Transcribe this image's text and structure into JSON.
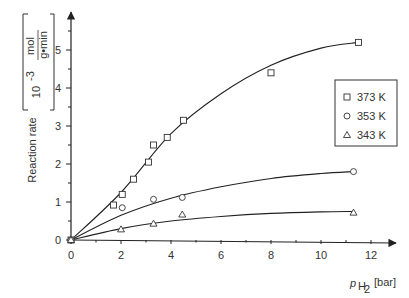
{
  "chart_data": {
    "type": "scatter",
    "title": "",
    "xlabel": "p_H2 [bar]",
    "xlabel_main": "p",
    "xlabel_sub": "H",
    "xlabel_subsub": "2",
    "xlabel_unit": "[bar]",
    "ylabel": "Reaction rate [10^-3 mol/(g·min)]",
    "ylabel_main": "Reaction rate",
    "ylabel_unit_factor": "10",
    "ylabel_unit_exp": "-3",
    "ylabel_unit_num": "mol",
    "ylabel_unit_den": "g•min",
    "xlim": [
      0,
      13
    ],
    "ylim": [
      0,
      6
    ],
    "x_ticks": [
      0,
      2,
      4,
      6,
      8,
      10,
      12
    ],
    "y_ticks": [
      0,
      1,
      2,
      3,
      4,
      5
    ],
    "grid": false,
    "legend_position": "right",
    "series": [
      {
        "name": "373 K",
        "marker": "square",
        "points": [
          [
            0,
            0
          ],
          [
            1.7,
            0.92
          ],
          [
            2.05,
            1.2
          ],
          [
            2.5,
            1.6
          ],
          [
            3.1,
            2.05
          ],
          [
            3.3,
            2.5
          ],
          [
            3.85,
            2.7
          ],
          [
            4.5,
            3.15
          ],
          [
            8.0,
            4.4
          ],
          [
            11.5,
            5.2
          ]
        ],
        "fit_curve": [
          [
            0,
            0
          ],
          [
            2,
            1.25
          ],
          [
            4,
            2.8
          ],
          [
            6,
            3.85
          ],
          [
            8,
            4.6
          ],
          [
            10,
            5.05
          ],
          [
            11.5,
            5.2
          ]
        ]
      },
      {
        "name": "353 K",
        "marker": "circle",
        "points": [
          [
            0,
            0
          ],
          [
            2.05,
            0.85
          ],
          [
            3.3,
            1.07
          ],
          [
            4.45,
            1.12
          ],
          [
            11.3,
            1.8
          ]
        ],
        "fit_curve": [
          [
            0,
            0
          ],
          [
            2,
            0.65
          ],
          [
            4,
            1.1
          ],
          [
            6,
            1.4
          ],
          [
            8,
            1.62
          ],
          [
            10,
            1.75
          ],
          [
            11.3,
            1.8
          ]
        ]
      },
      {
        "name": "343 K",
        "marker": "triangle",
        "points": [
          [
            0,
            0
          ],
          [
            2.0,
            0.28
          ],
          [
            3.3,
            0.43
          ],
          [
            4.45,
            0.67
          ],
          [
            11.3,
            0.72
          ]
        ],
        "fit_curve": [
          [
            0,
            0
          ],
          [
            2,
            0.3
          ],
          [
            4,
            0.5
          ],
          [
            6,
            0.62
          ],
          [
            8,
            0.7
          ],
          [
            10,
            0.74
          ],
          [
            11.3,
            0.75
          ]
        ]
      }
    ]
  }
}
